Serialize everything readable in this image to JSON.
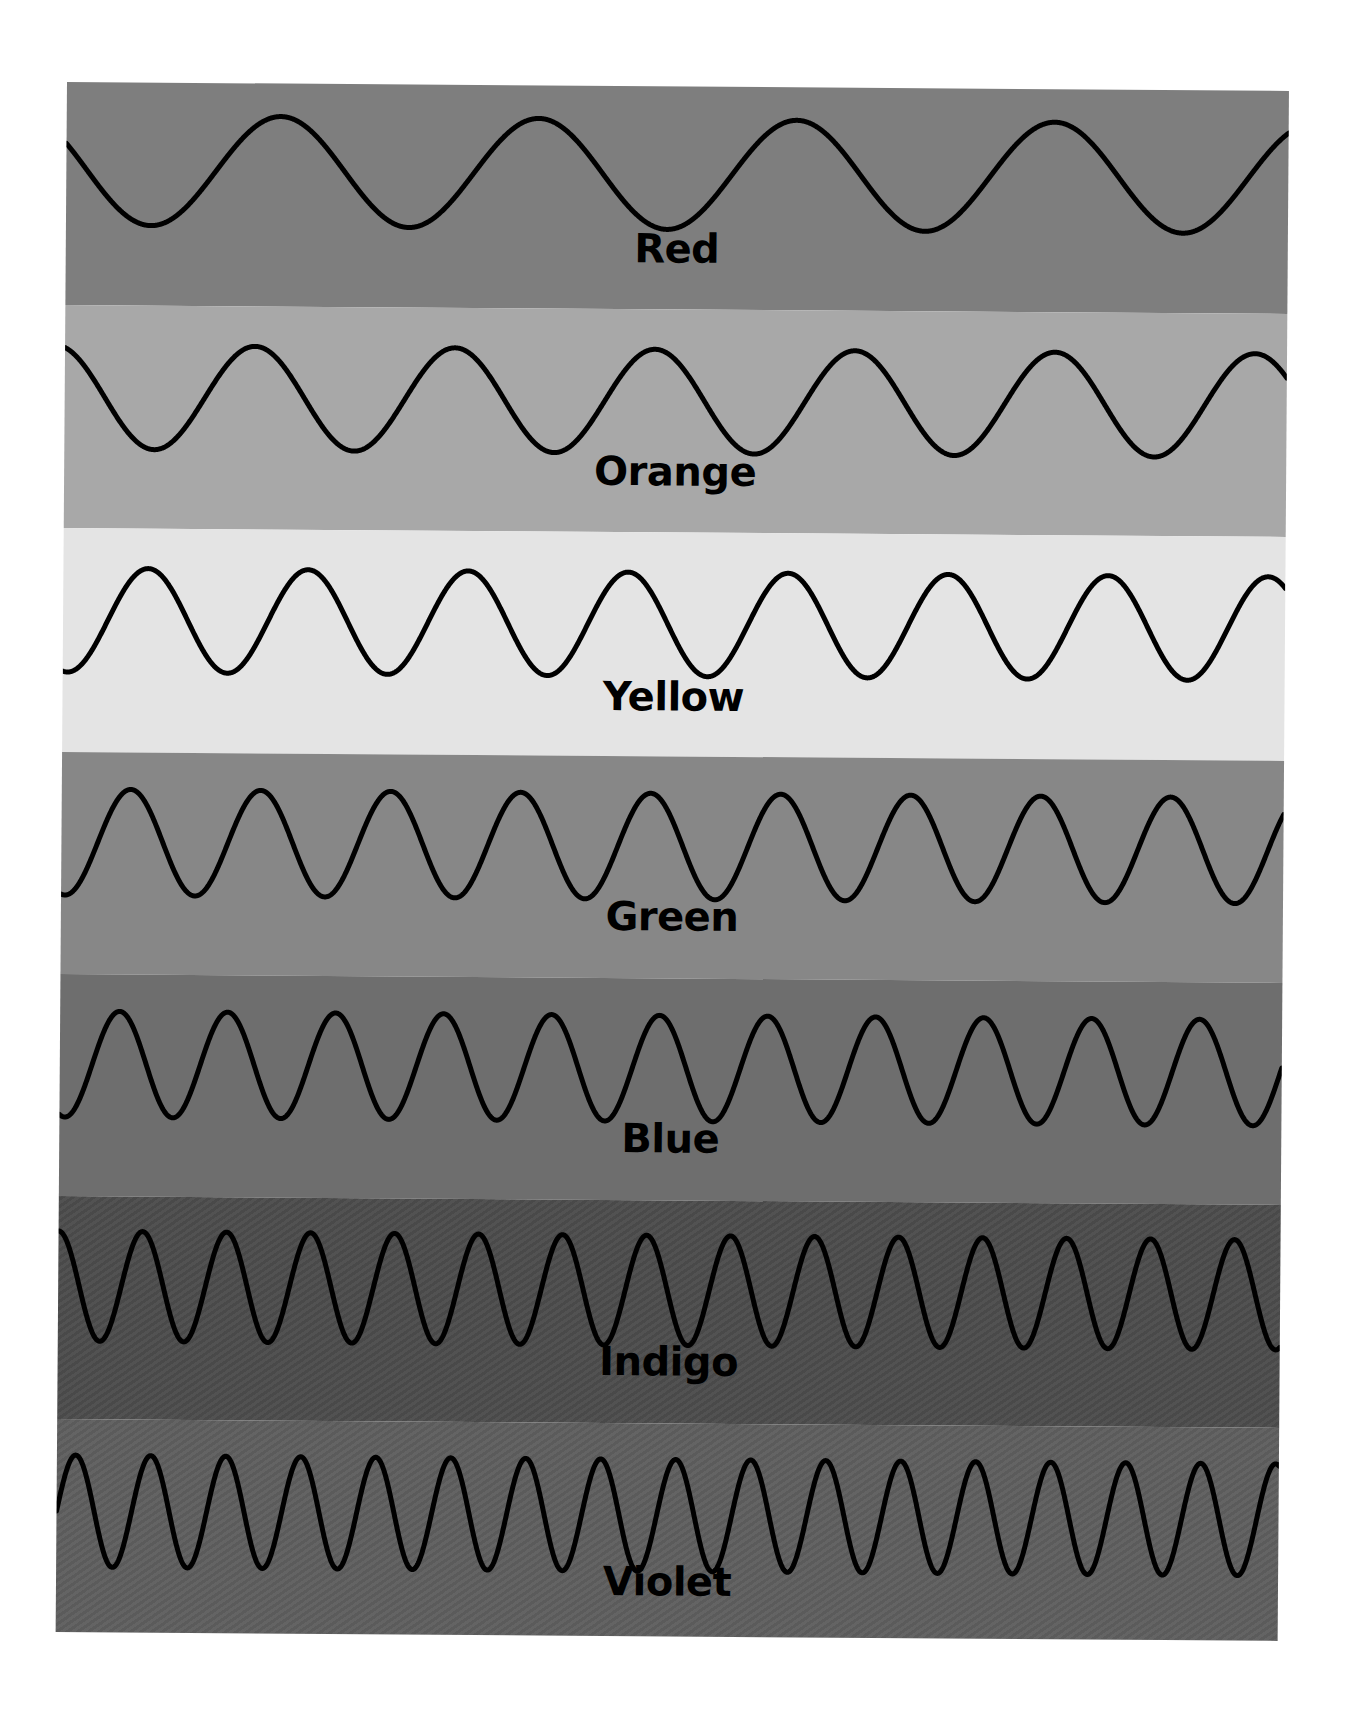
{
  "figure": {
    "stroke_color": "#000000",
    "stroke_width": 5,
    "width": 1222,
    "bands": [
      {
        "label": "Red",
        "bg": "#7e7e7e",
        "top": 0,
        "height": 223,
        "wave_center": 88,
        "amplitude": 55,
        "period": 258,
        "phase": 0.42,
        "label_top": 142,
        "striped": false
      },
      {
        "label": "Orange",
        "bg": "#a8a8a8",
        "top": 223,
        "height": 223,
        "wave_center": 92,
        "amplitude": 52,
        "period": 200,
        "phase": 0.3,
        "label_top": 142,
        "striped": false
      },
      {
        "label": "Yellow",
        "bg": "#e4e4e4",
        "top": 446,
        "height": 224,
        "wave_center": 92,
        "amplitude": 52,
        "period": 160,
        "phase": 0.72,
        "label_top": 144,
        "striped": false
      },
      {
        "label": "Green",
        "bg": "#878787",
        "top": 670,
        "height": 222,
        "wave_center": 90,
        "amplitude": 53,
        "period": 130,
        "phase": 0.72,
        "label_top": 140,
        "striped": false
      },
      {
        "label": "Blue",
        "bg": "#6e6e6e",
        "top": 892,
        "height": 222,
        "wave_center": 90,
        "amplitude": 53,
        "period": 108,
        "phase": 0.7,
        "label_top": 140,
        "striped": false
      },
      {
        "label": "Indigo",
        "bg": "#4c4c4c",
        "top": 1114,
        "height": 223,
        "wave_center": 90,
        "amplitude": 55,
        "period": 84,
        "phase": 0.25,
        "label_top": 141,
        "striped": true
      },
      {
        "label": "Violet",
        "bg": "#5e5e5e",
        "top": 1337,
        "height": 213,
        "wave_center": 92,
        "amplitude": 56,
        "period": 75,
        "phase": 0.0,
        "label_top": 138,
        "striped": true
      }
    ]
  }
}
